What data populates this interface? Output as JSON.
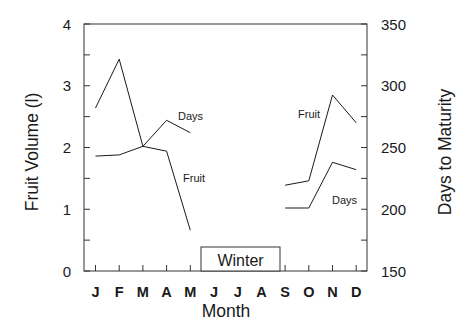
{
  "chart_data": {
    "type": "line",
    "title": "",
    "xlabel": "Month",
    "ylabel": "Fruit Volume (l)",
    "y2label": "Days to Maturity",
    "categories": [
      "J",
      "F",
      "M",
      "A",
      "M",
      "J",
      "J",
      "A",
      "S",
      "O",
      "N",
      "D"
    ],
    "ylim": [
      0,
      4
    ],
    "y2lim": [
      150,
      350
    ],
    "yticks": [
      "0",
      "1",
      "2",
      "3",
      "4"
    ],
    "y2ticks": [
      "150",
      "200",
      "250",
      "300",
      "350"
    ],
    "grid": false,
    "legend": "inline labels",
    "series": [
      {
        "name": "Fruit",
        "axis": "left",
        "values": [
          2.64,
          3.43,
          2.02,
          1.94,
          0.66,
          null,
          null,
          null,
          1.39,
          1.46,
          2.85,
          2.4
        ]
      },
      {
        "name": "Days",
        "axis": "right",
        "values": [
          243,
          244,
          251,
          272,
          262,
          null,
          null,
          null,
          201,
          201,
          238,
          232
        ]
      }
    ],
    "annotations": [
      {
        "text": "Winter",
        "span": [
          "J",
          "A"
        ],
        "type": "box"
      },
      {
        "text": "Days",
        "near": "A (first half)"
      },
      {
        "text": "Fruit",
        "near": "M-A (first half)"
      },
      {
        "text": "Fruit",
        "near": "O-N (second half)"
      },
      {
        "text": "Days",
        "near": "N (second half)"
      }
    ]
  },
  "labels": {
    "xlabel": "Month",
    "ylabel": "Fruit Volume (l)",
    "y2label": "Days to Maturity",
    "winter": "Winter",
    "days_left": "Days",
    "fruit_left": "Fruit",
    "fruit_right": "Fruit",
    "days_right": "Days"
  },
  "colors": {
    "line": "#1a1a1a",
    "axis": "#333333",
    "background": "#ffffff"
  }
}
